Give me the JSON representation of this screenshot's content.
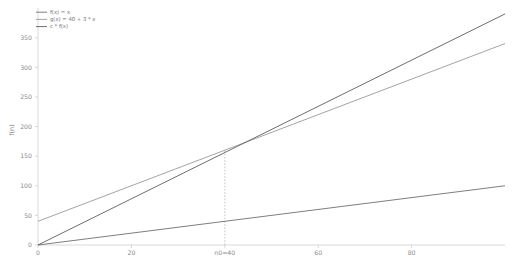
{
  "chart_data": {
    "type": "line",
    "title": "",
    "subtitle": "",
    "xlabel": "",
    "ylabel": "f(n)",
    "xlim": [
      0,
      100
    ],
    "ylim": [
      0,
      400
    ],
    "grid": false,
    "legend_position": "top-left",
    "x_ticks": [
      {
        "value": 0,
        "label": "0"
      },
      {
        "value": 20,
        "label": "20"
      },
      {
        "value": 40,
        "label": "n0=40"
      },
      {
        "value": 60,
        "label": "60"
      },
      {
        "value": 80,
        "label": "80"
      }
    ],
    "y_ticks": [
      {
        "value": 0,
        "label": "0"
      },
      {
        "value": 50,
        "label": "50"
      },
      {
        "value": 100,
        "label": "100"
      },
      {
        "value": 150,
        "label": "150"
      },
      {
        "value": 200,
        "label": "200"
      },
      {
        "value": 250,
        "label": "250"
      },
      {
        "value": 300,
        "label": "300"
      },
      {
        "value": 350,
        "label": "350"
      }
    ],
    "series": [
      {
        "name": "f(x) = x",
        "color": "#6f6f6f",
        "x": [
          0,
          100
        ],
        "values": [
          0,
          100
        ]
      },
      {
        "name": "g(x) = 40 + 3 * x",
        "color": "#9a9a9a",
        "x": [
          0,
          100
        ],
        "values": [
          40,
          340
        ]
      },
      {
        "name": "c * f(x)",
        "color": "#5c5c5c",
        "x": [
          0,
          100
        ],
        "values": [
          0,
          390
        ]
      }
    ],
    "annotations": [
      {
        "name": "n0-crossover-guide",
        "type": "vertical-dashed-line",
        "x": 40,
        "y_from": 0,
        "y_to": 160,
        "label": "n0=40"
      }
    ]
  }
}
